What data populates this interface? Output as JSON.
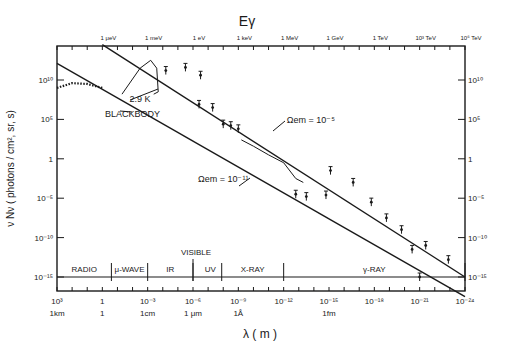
{
  "chart_data": {
    "type": "line",
    "title": "Eγ",
    "top_axis": {
      "label": "Eγ",
      "ticks": [
        {
          "label": "1 μeV",
          "lambda_exp": 0
        },
        {
          "label": "1 meV",
          "lambda_exp": -3
        },
        {
          "label": "1 eV",
          "lambda_exp": -6
        },
        {
          "label": "1 keV",
          "lambda_exp": -9
        },
        {
          "label": "1 MeV",
          "lambda_exp": -12
        },
        {
          "label": "1 GeV",
          "lambda_exp": -15
        },
        {
          "label": "1 TeV",
          "lambda_exp": -18
        },
        {
          "label": "10³ TeV",
          "lambda_exp": -21
        },
        {
          "label": "10⁶ TeV",
          "lambda_exp": -24
        }
      ]
    },
    "xlabel": "λ ( m )",
    "ylabel": "ν Nν ( photons / cm², sr, s)",
    "xscale": "log",
    "yscale": "log",
    "xlim_exp": [
      3,
      -24
    ],
    "ylim_exp": [
      -18.5,
      13
    ],
    "x_ticks": [
      {
        "label": "10³",
        "exp": 3,
        "unit": "1km"
      },
      {
        "label": "1",
        "exp": 0,
        "unit": "1"
      },
      {
        "label": "10⁻³",
        "exp": -3,
        "unit": "1cm"
      },
      {
        "label": "10⁻⁶",
        "exp": -6,
        "unit": "1 μm"
      },
      {
        "label": "10⁻⁹",
        "exp": -9,
        "unit": "1Å"
      },
      {
        "label": "10⁻¹²",
        "exp": -12,
        "unit": ""
      },
      {
        "label": "10⁻¹⁵",
        "exp": -15,
        "unit": "1fm"
      },
      {
        "label": "10⁻¹⁸",
        "exp": -18,
        "unit": ""
      },
      {
        "label": "10⁻²¹",
        "exp": -21,
        "unit": ""
      },
      {
        "label": "10⁻²⁴",
        "exp": -24,
        "unit": ""
      }
    ],
    "y_ticks": [
      {
        "label": "10¹⁰",
        "exp": 10
      },
      {
        "label": "10⁵",
        "exp": 5
      },
      {
        "label": "1",
        "exp": 0
      },
      {
        "label": "10⁻⁵",
        "exp": -5
      },
      {
        "label": "10⁻¹⁰",
        "exp": -10
      },
      {
        "label": "10⁻¹⁵",
        "exp": -15
      }
    ],
    "series": [
      {
        "name": "Ωem = 10⁻⁵",
        "style": "line",
        "points": [
          [
            0,
            14.5
          ],
          [
            -24,
            -15
          ]
        ]
      },
      {
        "name": "Ωem = 10⁻¹¹",
        "style": "line",
        "points": [
          [
            3,
            12.1
          ],
          [
            -24,
            -17.5
          ]
        ]
      },
      {
        "name": "2.9 K blackbody",
        "style": "curve",
        "points": [
          [
            -1.3,
            8.2
          ],
          [
            -2.5,
            11.5
          ],
          [
            -3.2,
            12.5
          ],
          [
            -3.6,
            11.5
          ],
          [
            -3.7,
            8.5
          ],
          [
            -3.4,
            8.2
          ]
        ]
      },
      {
        "name": "radio background",
        "style": "dotted",
        "points": [
          [
            3,
            9
          ],
          [
            2,
            9.6
          ],
          [
            1,
            9.5
          ],
          [
            0,
            9
          ]
        ]
      },
      {
        "name": "diffuse X-ray",
        "style": "curve",
        "points": [
          [
            -9.2,
            2.4
          ],
          [
            -10,
            1.6
          ],
          [
            -11,
            0.5
          ],
          [
            -12,
            -0.5
          ],
          [
            -12.8,
            -2.5
          ],
          [
            -13.3,
            -3
          ]
        ]
      }
    ],
    "measurements": [
      {
        "lambda_exp": -4.2,
        "y_exp": 11.2
      },
      {
        "lambda_exp": -5.5,
        "y_exp": 11.6
      },
      {
        "lambda_exp": -6.5,
        "y_exp": 10.6
      },
      {
        "lambda_exp": -6.4,
        "y_exp": 6.9
      },
      {
        "lambda_exp": -7.3,
        "y_exp": 6.5
      },
      {
        "lambda_exp": -8.0,
        "y_exp": 4.4
      },
      {
        "lambda_exp": -8.5,
        "y_exp": 4.2
      },
      {
        "lambda_exp": -9.0,
        "y_exp": 3.8
      },
      {
        "lambda_exp": -12.8,
        "y_exp": -4.5
      },
      {
        "lambda_exp": -13.5,
        "y_exp": -4.8
      },
      {
        "lambda_exp": -14.8,
        "y_exp": -4.6
      },
      {
        "lambda_exp": -15.1,
        "y_exp": -1.5
      },
      {
        "lambda_exp": -16.6,
        "y_exp": -3
      },
      {
        "lambda_exp": -17.8,
        "y_exp": -5.5
      },
      {
        "lambda_exp": -18.8,
        "y_exp": -7.5
      },
      {
        "lambda_exp": -19.8,
        "y_exp": -9
      },
      {
        "lambda_exp": -20.5,
        "y_exp": -11.5
      },
      {
        "lambda_exp": -21.4,
        "y_exp": -11
      },
      {
        "lambda_exp": -22.9,
        "y_exp": -12.8
      },
      {
        "lambda_exp": -21,
        "y_exp": -15
      }
    ],
    "annotations": [
      {
        "text": "2.9 K",
        "lambda_exp": -2.5,
        "y_exp": 7.2
      },
      {
        "text": "BLACKBODY",
        "lambda_exp": -2.0,
        "y_exp": 5.3
      },
      {
        "text": "Ωem = 10⁻⁵",
        "lambda_exp": -13.8,
        "y_exp": 4.5
      },
      {
        "text": "Ωem = 10⁻¹¹",
        "lambda_exp": -8.0,
        "y_exp": -3.0
      }
    ],
    "bands": [
      {
        "label": "RADIO",
        "from_exp": 3,
        "to_exp": -0.6
      },
      {
        "label": "μ-WAVE",
        "from_exp": -0.6,
        "to_exp": -3
      },
      {
        "label": "IR",
        "from_exp": -3,
        "to_exp": -6
      },
      {
        "label": "UV",
        "from_exp": -6.4,
        "to_exp": -7.9
      },
      {
        "label": "X-RAY",
        "from_exp": -7.9,
        "to_exp": -12
      },
      {
        "label": "γ-RAY",
        "from_exp": -12,
        "to_exp": -24
      }
    ],
    "visible_label": "VISIBLE",
    "grid": false
  }
}
